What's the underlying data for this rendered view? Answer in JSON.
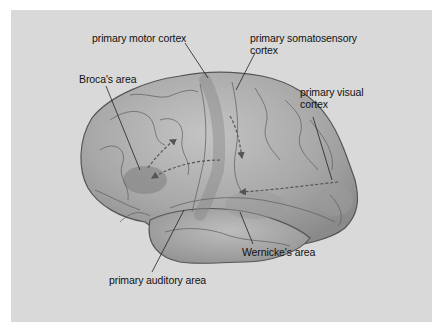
{
  "diagram": {
    "background_color": "#d9d9d9",
    "brain_color": "#a9a9a9",
    "labels": {
      "primary_motor_cortex": "primary motor cortex",
      "primary_somatosensory_cortex_line1": "primary somatosensory",
      "primary_somatosensory_cortex_line2": "cortex",
      "brocas_area": "Broca's area",
      "primary_visual_cortex_line1": "primary visual",
      "primary_visual_cortex_line2": "cortex",
      "wernickes_area": "Wernicke's area",
      "primary_auditory_area": "primary auditory area"
    },
    "arrows": [
      {
        "from": "primary visual cortex",
        "to": "Wernicke's area",
        "style": "dashed"
      },
      {
        "from": "Wernicke's area",
        "to": "Broca's area",
        "style": "dashed"
      },
      {
        "from": "primary somatosensory cortex",
        "to": "Wernicke's area",
        "style": "dashed"
      },
      {
        "from": "Broca's area",
        "to": "primary motor cortex",
        "style": "dashed"
      }
    ]
  }
}
